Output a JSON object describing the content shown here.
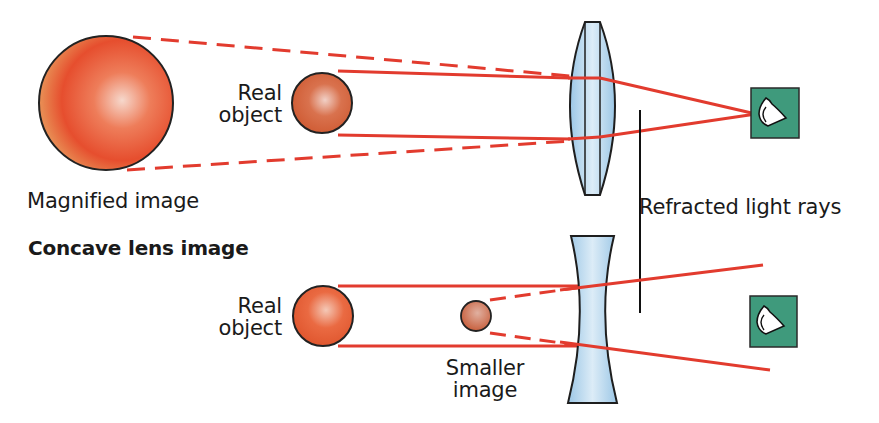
{
  "diagram": {
    "type": "optics-lens-comparison",
    "colors": {
      "ray": "#e23b2e",
      "lens_fill": "#b9d8ee",
      "lens_stroke": "#1e1e1e",
      "eye_box": "#3f9a7c",
      "sphere": "#e85a38",
      "text": "#1a1a1a",
      "background": "#ffffff"
    },
    "convex_section": {
      "magnified_image_label": "Magnified image",
      "real_object_label_line1": "Real",
      "real_object_label_line2": "object"
    },
    "shared": {
      "refracted_rays_label": "Refracted light rays"
    },
    "concave_section": {
      "title": "Concave lens image",
      "real_object_label_line1": "Real",
      "real_object_label_line2": "object",
      "smaller_image_label_line1": "Smaller",
      "smaller_image_label_line2": "image"
    }
  }
}
